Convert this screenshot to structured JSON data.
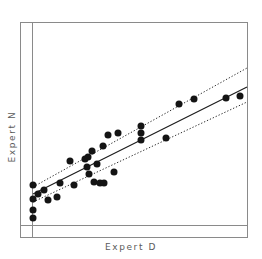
{
  "chart_data": {
    "type": "scatter",
    "title": "",
    "subtitle": "",
    "xlabel": "Expert D",
    "ylabel": "Expert N",
    "xlim": [
      0,
      100
    ],
    "ylim": [
      0,
      100
    ],
    "grid": false,
    "legend": null,
    "xticks": [],
    "yticks": [],
    "annotations": [],
    "marker": {
      "shape": "circle",
      "filled": true,
      "color": "#141414",
      "size_px": 7
    },
    "points": [
      {
        "px": 33,
        "py": 185,
        "x": 1.6,
        "y": 19.0
      },
      {
        "px": 33,
        "py": 199,
        "x": 1.6,
        "y": 12.6
      },
      {
        "px": 33,
        "py": 210,
        "x": 1.6,
        "y": 7.6
      },
      {
        "px": 33,
        "py": 218,
        "x": 1.6,
        "y": 3.9
      },
      {
        "px": 38,
        "py": 194,
        "x": 4.0,
        "y": 14.9
      },
      {
        "px": 44,
        "py": 190,
        "x": 6.8,
        "y": 16.7
      },
      {
        "px": 48,
        "py": 200,
        "x": 8.6,
        "y": 12.2
      },
      {
        "px": 57,
        "py": 197,
        "x": 12.8,
        "y": 13.6
      },
      {
        "px": 60,
        "py": 183,
        "x": 14.2,
        "y": 19.9
      },
      {
        "px": 70,
        "py": 161,
        "x": 18.8,
        "y": 30.1
      },
      {
        "px": 74,
        "py": 185,
        "x": 20.7,
        "y": 19.0
      },
      {
        "px": 85,
        "py": 159,
        "x": 25.8,
        "y": 31.0
      },
      {
        "px": 87,
        "py": 167,
        "x": 26.7,
        "y": 27.4
      },
      {
        "px": 88,
        "py": 157,
        "x": 27.2,
        "y": 32.0
      },
      {
        "px": 89,
        "py": 174,
        "x": 27.6,
        "y": 24.2
      },
      {
        "px": 92,
        "py": 151,
        "x": 29.0,
        "y": 34.7
      },
      {
        "px": 94,
        "py": 182,
        "x": 30.0,
        "y": 20.4
      },
      {
        "px": 97,
        "py": 164,
        "x": 31.3,
        "y": 28.7
      },
      {
        "px": 100,
        "py": 183,
        "x": 32.7,
        "y": 19.9
      },
      {
        "px": 103,
        "py": 146,
        "x": 34.1,
        "y": 37.0
      },
      {
        "px": 104,
        "py": 183,
        "x": 34.6,
        "y": 19.9
      },
      {
        "px": 108,
        "py": 135,
        "x": 36.4,
        "y": 42.1
      },
      {
        "px": 114,
        "py": 172,
        "x": 39.2,
        "y": 25.1
      },
      {
        "px": 118,
        "py": 133,
        "x": 41.0,
        "y": 43.0
      },
      {
        "px": 141,
        "py": 126,
        "x": 51.6,
        "y": 46.2
      },
      {
        "px": 141,
        "py": 133,
        "x": 51.6,
        "y": 43.0
      },
      {
        "px": 141,
        "py": 140,
        "x": 51.6,
        "y": 39.8
      },
      {
        "px": 166,
        "py": 138,
        "x": 63.2,
        "y": 40.7
      },
      {
        "px": 179,
        "py": 104,
        "x": 69.2,
        "y": 56.4
      },
      {
        "px": 194,
        "py": 99,
        "x": 76.2,
        "y": 58.7
      },
      {
        "px": 226,
        "py": 98,
        "x": 91.0,
        "y": 59.2
      },
      {
        "px": 240,
        "py": 96,
        "x": 97.4,
        "y": 60.1
      }
    ],
    "fit_line": {
      "name": "regression line",
      "style": "solid",
      "color": "#1a1a1a",
      "p1": {
        "px": 33,
        "py": 194
      },
      "p2": {
        "px": 247,
        "py": 87
      }
    },
    "confidence_bands": [
      {
        "name": "upper confidence band",
        "style": "dotted",
        "color": "#2b2b2b",
        "p1": {
          "px": 33,
          "py": 187
        },
        "p2": {
          "px": 247,
          "py": 68
        }
      },
      {
        "name": "lower confidence band",
        "style": "dotted",
        "color": "#2b2b2b",
        "p1": {
          "px": 33,
          "py": 202
        },
        "p2": {
          "px": 247,
          "py": 102
        }
      }
    ],
    "frame": {
      "color": "#808080",
      "outer": {
        "x": 20,
        "y": 22,
        "w": 228,
        "h": 216
      },
      "inner_y_axis_px": 33,
      "inner_x_axis_py": 225
    }
  }
}
